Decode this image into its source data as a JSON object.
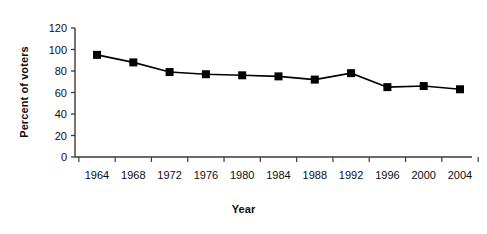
{
  "chart_data": {
    "type": "line",
    "title": "",
    "xlabel": "Year",
    "ylabel": "Percent of voters",
    "categories": [
      "1964",
      "1968",
      "1972",
      "1976",
      "1980",
      "1984",
      "1988",
      "1992",
      "1996",
      "2000",
      "2004"
    ],
    "x": [
      1964,
      1968,
      1972,
      1976,
      1980,
      1984,
      1988,
      1992,
      1996,
      2000,
      2004
    ],
    "values": [
      95,
      88,
      79,
      77,
      76,
      75,
      72,
      78,
      65,
      66,
      63
    ],
    "ylim": [
      0,
      120
    ],
    "yticks": [
      0,
      20,
      40,
      60,
      80,
      100,
      120
    ],
    "ytick_labels": [
      "0",
      "20",
      "40",
      "60",
      "80",
      "100",
      "120"
    ],
    "grid": false,
    "legend": "none",
    "series": [
      {
        "name": "Percent of voters",
        "marker": "square",
        "marker_color": "#000000",
        "line_color": "#000000",
        "values": [
          95,
          88,
          79,
          77,
          76,
          75,
          72,
          78,
          65,
          66,
          63
        ]
      }
    ]
  },
  "colors": {
    "background": "#ffffff",
    "axis": "#3a3a3a",
    "data": "#000000",
    "text": "#0d0d0d"
  }
}
